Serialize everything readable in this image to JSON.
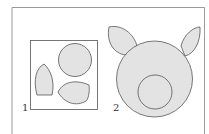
{
  "figure": {
    "labels": [
      "1",
      "2"
    ],
    "colors": {
      "fill": "#e3e3e3",
      "stroke": "#555555",
      "frame": "#9a9a9a"
    },
    "panel_1": {
      "description": "Cut-out pieces: circle, two leaf-shaped ears inside a square box"
    },
    "panel_2": {
      "description": "Assembled pig face: large circle with two ears and a smaller circle snout"
    }
  }
}
